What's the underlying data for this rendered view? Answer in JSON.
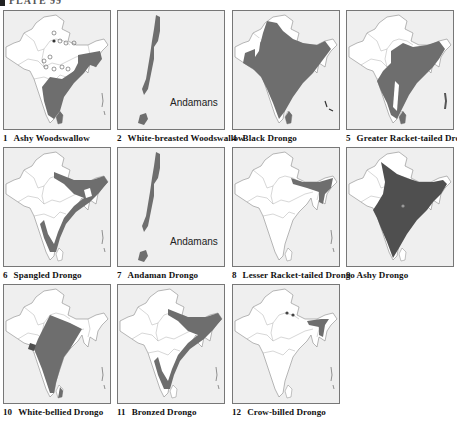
{
  "plate": {
    "title": "PLATE 99"
  },
  "colors": {
    "range_fill": "#6e6e6e",
    "range_dark": "#4f4f4f",
    "map_bg": "#efefef",
    "land": "#ffffff",
    "border": "#777777"
  },
  "panels": [
    {
      "number": "1",
      "species": "Ashy Woodswallow",
      "type": "india"
    },
    {
      "number": "2",
      "species": "White-breasted Woodswallow",
      "type": "andamans",
      "label": "Andamans"
    },
    {
      "number": "4",
      "species": "Black Drongo",
      "type": "india"
    },
    {
      "number": "5",
      "species": "Greater Racket-tailed Drongo",
      "type": "india"
    },
    {
      "number": "6",
      "species": "Spangled Drongo",
      "type": "india"
    },
    {
      "number": "7",
      "species": "Andaman Drongo",
      "type": "andamans",
      "label": "Andamans"
    },
    {
      "number": "8",
      "species": "Lesser Racket-tailed Drongo",
      "type": "india"
    },
    {
      "number": "9",
      "species": "Ashy Drongo",
      "type": "india"
    },
    {
      "number": "10",
      "species": "White-bellied Drongo",
      "type": "india"
    },
    {
      "number": "11",
      "species": "Bronzed Drongo",
      "type": "india"
    },
    {
      "number": "12",
      "species": "Crow-billed Drongo",
      "type": "india"
    }
  ]
}
